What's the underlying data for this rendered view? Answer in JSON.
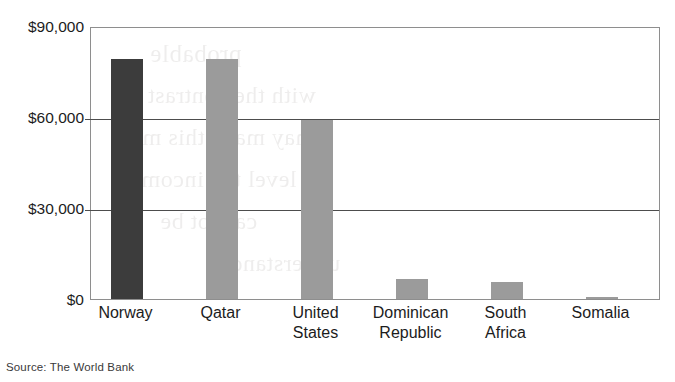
{
  "chart_data": {
    "type": "bar",
    "title": "",
    "subtitle": "",
    "xlabel": "",
    "ylabel": "",
    "categories": [
      "Norway",
      "Qatar",
      "United States",
      "Dominican Republic",
      "South Africa",
      "Somalia"
    ],
    "category_lines": [
      [
        "Norway"
      ],
      [
        "Qatar"
      ],
      [
        "United",
        "States"
      ],
      [
        "Dominican",
        "Republic"
      ],
      [
        "South",
        "Africa"
      ],
      [
        "Somalia"
      ]
    ],
    "values": [
      79000,
      79000,
      59000,
      6500,
      5500,
      500
    ],
    "bar_colors": [
      "#3c3c3c",
      "#9b9b9b",
      "#9b9b9b",
      "#9b9b9b",
      "#9b9b9b",
      "#9b9b9b"
    ],
    "ylim": [
      0,
      90000
    ],
    "yticks": [
      0,
      30000,
      60000,
      90000
    ],
    "ytick_labels": [
      "$0",
      "$30,000",
      "$60,000",
      "$90,000"
    ],
    "grid": true,
    "grid_axis": "y",
    "legend": false,
    "legend_position": "none"
  },
  "caption": {
    "source": "Source: The World Bank"
  },
  "axis": {
    "tick_labels": [
      "$90,000",
      "$60,000",
      "$30,000",
      "$0"
    ]
  },
  "bleed_text": {
    "lines": [
      "probable",
      "with the contrast of",
      "may make this more",
      "to level the income",
      "cannot be",
      "understand"
    ]
  }
}
